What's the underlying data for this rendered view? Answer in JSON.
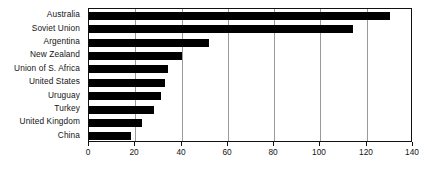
{
  "chart_data": {
    "type": "bar",
    "orientation": "horizontal",
    "title": "",
    "xlabel": "",
    "ylabel": "",
    "xlim": [
      0,
      140
    ],
    "xticks": [
      0,
      20,
      40,
      60,
      80,
      100,
      120,
      140
    ],
    "xtick_labels": [
      "0",
      "20",
      "40",
      "60",
      "80",
      "100",
      "120",
      "140"
    ],
    "grid": true,
    "grid_axis": "x",
    "legend": false,
    "bar_color": "#000000",
    "categories": [
      "Australia",
      "Soviet Union",
      "Argentina",
      "New  Zealand",
      "Union of S. Africa",
      "United States",
      "Uruguay",
      "Turkey",
      "United Kingdom",
      "China"
    ],
    "values": [
      130,
      114,
      52,
      40,
      34,
      33,
      31,
      28,
      23,
      18
    ]
  }
}
